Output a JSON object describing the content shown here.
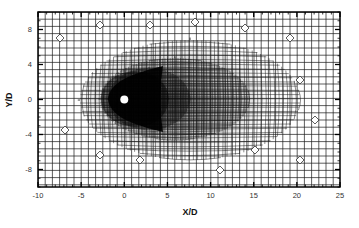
{
  "figure": {
    "type": "mesh",
    "xlabel": "X/D",
    "ylabel": "Y/D",
    "xlim": [
      -10,
      25
    ],
    "ylim": [
      -10,
      10
    ],
    "xticks": [
      {
        "value": -10,
        "label": "-10"
      },
      {
        "value": -5,
        "label": "-5"
      },
      {
        "value": 0,
        "label": "0"
      },
      {
        "value": 5,
        "label": "5"
      },
      {
        "value": 10,
        "label": "10"
      },
      {
        "value": 15,
        "label": "15"
      },
      {
        "value": 20,
        "label": "20"
      },
      {
        "value": 25,
        "label": "25"
      }
    ],
    "yticks": [
      {
        "value": 8,
        "label": "8"
      },
      {
        "value": 4,
        "label": "4"
      },
      {
        "value": 0,
        "label": "0"
      },
      {
        "value": -4,
        "label": "-4"
      },
      {
        "value": -8,
        "label": "-8"
      }
    ],
    "cylinder": {
      "x": 0,
      "y": 0,
      "diameter": 1,
      "fill": "#ffffff"
    },
    "colors": {
      "mesh": "#1a1a1a",
      "frame": "#000000",
      "background": "#ffffff",
      "dense_region": "#000000"
    }
  }
}
